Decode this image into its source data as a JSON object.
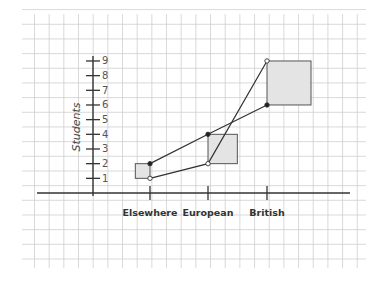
{
  "chart_data": {
    "type": "line",
    "title": "",
    "xlabel": "",
    "ylabel": "Students",
    "categories": [
      "Elsewhere",
      "European",
      "British"
    ],
    "yticks": [
      1,
      2,
      3,
      4,
      5,
      6,
      7,
      8,
      9
    ],
    "ylim": [
      0,
      9
    ],
    "grid": true,
    "series": [
      {
        "name": "upper (filled markers)",
        "marker": "filled",
        "values": [
          2,
          4,
          6
        ]
      },
      {
        "name": "lower (open markers)",
        "marker": "open",
        "values": [
          1,
          2,
          9
        ]
      }
    ],
    "boxes": [
      {
        "category": "Elsewhere",
        "low": 1,
        "high": 2,
        "side": "left"
      },
      {
        "category": "European",
        "low": 2,
        "high": 4,
        "side": "right"
      },
      {
        "category": "British",
        "low": 6,
        "high": 9,
        "side": "right"
      }
    ]
  },
  "colors": {
    "grid": "#cfcfcf",
    "axis": "#333333",
    "box_fill": "#e4e4e4",
    "box_stroke": "#555555",
    "line": "#333333"
  }
}
